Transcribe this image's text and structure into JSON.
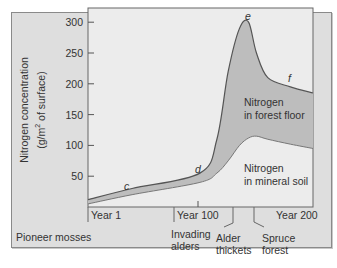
{
  "chart_data": {
    "type": "area",
    "title": "",
    "xlabel": "",
    "ylabel": "Nitrogen concentration (g/m² of surface)",
    "ylabel_line1": "Nitrogen concentration",
    "ylabel_line2_prefix": "(g/m",
    "ylabel_line2_sup": "2",
    "ylabel_line2_suffix": " of surface)",
    "ylim": [
      0,
      310
    ],
    "xlim": [
      1,
      200
    ],
    "yticks": [
      50,
      100,
      150,
      200,
      250,
      300
    ],
    "ytick_labels": [
      "50",
      "100",
      "150",
      "200",
      "250",
      "300"
    ],
    "xtick_labels": [
      "Year 1",
      "Year 100",
      "Year 200"
    ],
    "grid": false,
    "x": [
      1,
      40,
      100,
      115,
      125,
      135,
      143,
      150,
      160,
      180,
      200
    ],
    "series": [
      {
        "name": "Total nitrogen (forest floor + mineral soil)",
        "values": [
          12,
          30,
          55,
          110,
          220,
          290,
          300,
          250,
          210,
          195,
          185
        ]
      },
      {
        "name": "Nitrogen in mineral soil",
        "values": [
          5,
          20,
          40,
          55,
          75,
          100,
          112,
          115,
          110,
          102,
          95
        ]
      }
    ],
    "regions": [
      {
        "label_line1": "Nitrogen",
        "label_line2": "in forest floor"
      },
      {
        "label_line1": "Nitrogen",
        "label_line2": "in mineral soil"
      }
    ],
    "point_labels": [
      "c",
      "d",
      "e",
      "f"
    ],
    "stage_labels": [
      {
        "line1": "Pioneer mosses",
        "line2": ""
      },
      {
        "line1": "Invading",
        "line2": "alders"
      },
      {
        "line1": "Alder",
        "line2": "thickets"
      },
      {
        "line1": "Spruce",
        "line2": "forest"
      }
    ],
    "colors": {
      "frame_bg": "#dedede",
      "plot_bg": "#ececec",
      "forest_floor_fill": "#bdbdbd",
      "line": "#555555"
    }
  }
}
